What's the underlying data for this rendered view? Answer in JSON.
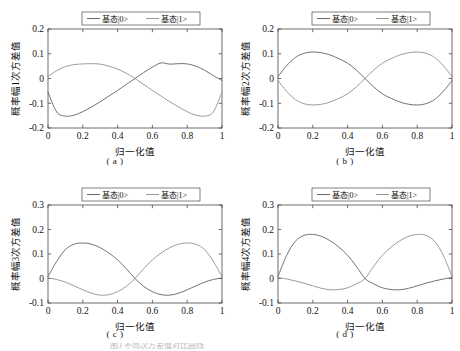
{
  "figure": {
    "panel_count": 4,
    "background_color": "#ffffff",
    "series_colors": [
      "#5a5a5a",
      "#8a8a8a"
    ],
    "axis_color": "#4a4a4a",
    "footer_partial_text": "图3 不同次方差值对比曲线"
  },
  "legend": {
    "entries": [
      {
        "label": "基态|0>",
        "color": "#5a5a5a",
        "style": "solid"
      },
      {
        "label": "基态|1>",
        "color": "#8a8a8a",
        "style": "solid"
      }
    ]
  },
  "panels": [
    {
      "caption": "( a )",
      "xlabel": "归一化值",
      "ylabel": "概率幅1次方差值"
    },
    {
      "caption": "( b )",
      "xlabel": "归一化值",
      "ylabel": "概率幅2次方差值"
    },
    {
      "caption": "( c )",
      "xlabel": "归一化值",
      "ylabel": "概率幅3次方差值"
    },
    {
      "caption": "( d )",
      "xlabel": "归一化值",
      "ylabel": "概率幅4次方差值"
    }
  ],
  "chart_data": [
    {
      "type": "line",
      "panel": "a",
      "title": "",
      "xlabel": "归一化值",
      "ylabel": "概率幅1次方差值",
      "xlim": [
        0,
        1
      ],
      "ylim": [
        -0.2,
        0.2
      ],
      "xticks": [
        0,
        0.2,
        0.4,
        0.6,
        0.8,
        1
      ],
      "xticklabels": [
        "0",
        "0.2",
        "0.4",
        "0.6",
        "0.8",
        "1"
      ],
      "yticks": [
        -0.2,
        -0.1,
        0,
        0.1,
        0.2
      ],
      "yticklabels": [
        "-0.2",
        "-0.1",
        "0",
        "0.1",
        "0.2"
      ],
      "grid": false,
      "legend_position": "above-center",
      "series": [
        {
          "name": "基态|0>",
          "color": "#5a5a5a",
          "x": [
            0,
            0.05,
            0.1,
            0.15,
            0.2,
            0.25,
            0.3,
            0.35,
            0.4,
            0.45,
            0.5,
            0.55,
            0.6,
            0.65,
            0.7,
            0.75,
            0.8,
            0.85,
            0.9,
            0.95,
            1
          ],
          "values": [
            -0.055,
            -0.135,
            -0.152,
            -0.148,
            -0.134,
            -0.115,
            -0.094,
            -0.071,
            -0.048,
            -0.024,
            0.0,
            0.024,
            0.046,
            0.063,
            0.058,
            0.06,
            0.059,
            0.05,
            0.033,
            0.012,
            -0.008
          ]
        },
        {
          "name": "基态|1>",
          "color": "#8a8a8a",
          "x": [
            0,
            0.05,
            0.1,
            0.15,
            0.2,
            0.25,
            0.3,
            0.35,
            0.4,
            0.45,
            0.5,
            0.55,
            0.6,
            0.65,
            0.7,
            0.75,
            0.8,
            0.85,
            0.9,
            0.95,
            1
          ],
          "values": [
            0.008,
            0.032,
            0.048,
            0.056,
            0.059,
            0.06,
            0.058,
            0.05,
            0.038,
            0.021,
            0.0,
            -0.024,
            -0.048,
            -0.071,
            -0.094,
            -0.115,
            -0.134,
            -0.148,
            -0.152,
            -0.135,
            -0.055
          ]
        }
      ]
    },
    {
      "type": "line",
      "panel": "b",
      "title": "",
      "xlabel": "归一化值",
      "ylabel": "概率幅2次方差值",
      "xlim": [
        0,
        1
      ],
      "ylim": [
        -0.2,
        0.2
      ],
      "xticks": [
        0,
        0.2,
        0.4,
        0.6,
        0.8,
        1
      ],
      "xticklabels": [
        "0",
        "0.2",
        "0.4",
        "0.6",
        "0.8",
        "1"
      ],
      "yticks": [
        -0.2,
        -0.1,
        0,
        0.1,
        0.2
      ],
      "yticklabels": [
        "-0.2",
        "-0.1",
        "0",
        "0.1",
        "0.2"
      ],
      "grid": false,
      "legend_position": "above-center",
      "series": [
        {
          "name": "基态|0>",
          "color": "#5a5a5a",
          "x": [
            0,
            0.05,
            0.1,
            0.15,
            0.2,
            0.25,
            0.3,
            0.35,
            0.4,
            0.45,
            0.5,
            0.55,
            0.6,
            0.65,
            0.7,
            0.75,
            0.8,
            0.85,
            0.9,
            0.95,
            1
          ],
          "values": [
            0.008,
            0.052,
            0.085,
            0.102,
            0.107,
            0.104,
            0.095,
            0.08,
            0.062,
            0.034,
            0.0,
            -0.034,
            -0.062,
            -0.08,
            -0.095,
            -0.104,
            -0.107,
            -0.102,
            -0.085,
            -0.052,
            -0.008
          ]
        },
        {
          "name": "基态|1>",
          "color": "#8a8a8a",
          "x": [
            0,
            0.05,
            0.1,
            0.15,
            0.2,
            0.25,
            0.3,
            0.35,
            0.4,
            0.45,
            0.5,
            0.55,
            0.6,
            0.65,
            0.7,
            0.75,
            0.8,
            0.85,
            0.9,
            0.95,
            1
          ],
          "values": [
            -0.008,
            -0.052,
            -0.085,
            -0.102,
            -0.107,
            -0.104,
            -0.095,
            -0.08,
            -0.062,
            -0.034,
            0.0,
            0.034,
            0.062,
            0.08,
            0.095,
            0.104,
            0.107,
            0.102,
            0.085,
            0.052,
            0.008
          ]
        }
      ]
    },
    {
      "type": "line",
      "panel": "c",
      "title": "",
      "xlabel": "归一化值",
      "ylabel": "概率幅3次方差值",
      "xlim": [
        0,
        1
      ],
      "ylim": [
        -0.1,
        0.3
      ],
      "xticks": [
        0,
        0.2,
        0.4,
        0.6,
        0.8,
        1
      ],
      "xticklabels": [
        "0",
        "0.2",
        "0.4",
        "0.6",
        "0.8",
        "1"
      ],
      "yticks": [
        -0.1,
        0,
        0.1,
        0.2,
        0.3
      ],
      "yticklabels": [
        "-0.1",
        "0",
        "0.1",
        "0.2",
        "0.3"
      ],
      "grid": false,
      "legend_position": "above-center",
      "series": [
        {
          "name": "基态|0>",
          "color": "#5a5a5a",
          "x": [
            0,
            0.05,
            0.1,
            0.15,
            0.2,
            0.25,
            0.3,
            0.35,
            0.4,
            0.45,
            0.5,
            0.55,
            0.6,
            0.65,
            0.7,
            0.75,
            0.8,
            0.85,
            0.9,
            0.95,
            1
          ],
          "values": [
            0.008,
            0.07,
            0.118,
            0.14,
            0.145,
            0.14,
            0.126,
            0.104,
            0.076,
            0.04,
            0.0,
            -0.032,
            -0.054,
            -0.066,
            -0.068,
            -0.06,
            -0.046,
            -0.03,
            -0.015,
            -0.004,
            0.002
          ]
        },
        {
          "name": "基态|1>",
          "color": "#8a8a8a",
          "x": [
            0,
            0.05,
            0.1,
            0.15,
            0.2,
            0.25,
            0.3,
            0.35,
            0.4,
            0.45,
            0.5,
            0.55,
            0.6,
            0.65,
            0.7,
            0.75,
            0.8,
            0.85,
            0.9,
            0.95,
            1
          ],
          "values": [
            0.002,
            -0.004,
            -0.015,
            -0.03,
            -0.046,
            -0.06,
            -0.068,
            -0.066,
            -0.054,
            -0.032,
            0.0,
            0.04,
            0.076,
            0.104,
            0.126,
            0.14,
            0.145,
            0.14,
            0.118,
            0.07,
            0.008
          ]
        }
      ]
    },
    {
      "type": "line",
      "panel": "d",
      "title": "",
      "xlabel": "归一化值",
      "ylabel": "概率幅4次方差值",
      "xlim": [
        0,
        1
      ],
      "ylim": [
        -0.1,
        0.3
      ],
      "xticks": [
        0,
        0.2,
        0.4,
        0.6,
        0.8,
        1
      ],
      "xticklabels": [
        "0",
        "0.2",
        "0.4",
        "0.6",
        "0.8",
        "1"
      ],
      "yticks": [
        -0.1,
        0,
        0.1,
        0.2,
        0.3
      ],
      "yticklabels": [
        "-0.1",
        "0",
        "0.1",
        "0.2",
        "0.3"
      ],
      "grid": false,
      "legend_position": "above-center",
      "series": [
        {
          "name": "基态|0>",
          "color": "#5a5a5a",
          "x": [
            0,
            0.05,
            0.1,
            0.15,
            0.2,
            0.25,
            0.3,
            0.35,
            0.4,
            0.45,
            0.5,
            0.55,
            0.6,
            0.65,
            0.7,
            0.75,
            0.8,
            0.85,
            0.9,
            0.95,
            1
          ],
          "values": [
            0.008,
            0.095,
            0.152,
            0.176,
            0.18,
            0.172,
            0.154,
            0.128,
            0.095,
            0.05,
            0.0,
            -0.022,
            -0.038,
            -0.045,
            -0.046,
            -0.04,
            -0.03,
            -0.019,
            -0.01,
            -0.002,
            0.004
          ]
        },
        {
          "name": "基态|1>",
          "color": "#8a8a8a",
          "x": [
            0,
            0.05,
            0.1,
            0.15,
            0.2,
            0.25,
            0.3,
            0.35,
            0.4,
            0.45,
            0.5,
            0.55,
            0.6,
            0.65,
            0.7,
            0.75,
            0.8,
            0.85,
            0.9,
            0.95,
            1
          ],
          "values": [
            0.004,
            -0.002,
            -0.01,
            -0.019,
            -0.03,
            -0.04,
            -0.046,
            -0.045,
            -0.038,
            -0.022,
            0.0,
            0.05,
            0.095,
            0.128,
            0.154,
            0.172,
            0.18,
            0.176,
            0.152,
            0.095,
            0.008
          ]
        }
      ]
    }
  ]
}
